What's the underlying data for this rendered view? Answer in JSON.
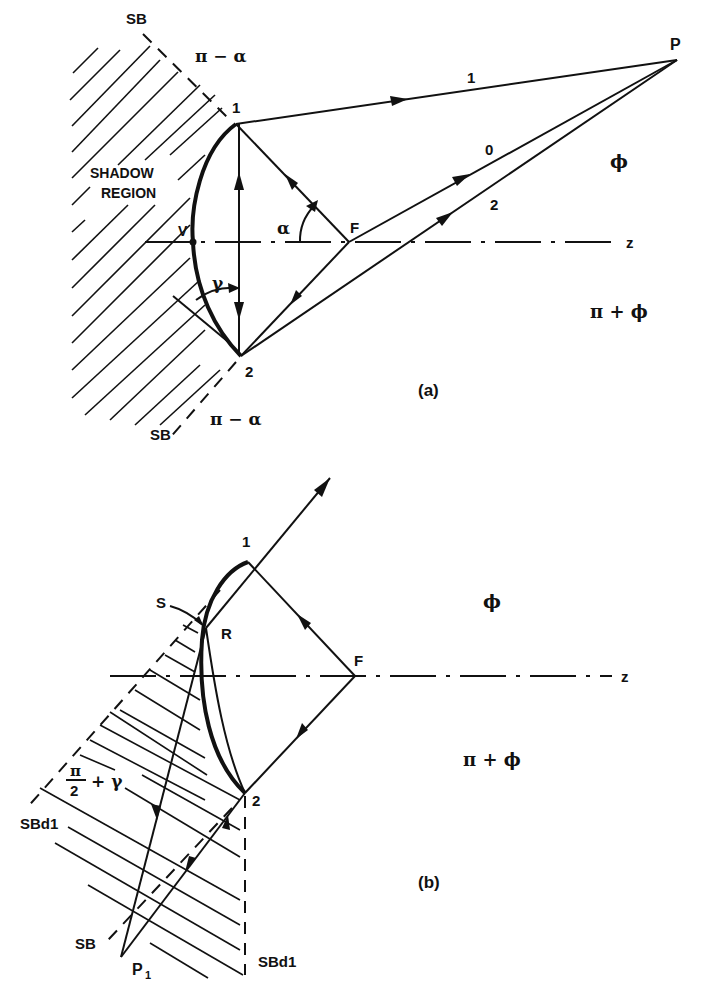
{
  "figure": {
    "panel_a": {
      "caption": "(a)",
      "shadow_region_line1": "SHADOW",
      "shadow_region_line2": "REGION",
      "sb_top": "SB",
      "sb_bottom": "SB",
      "angle_top": "π − α",
      "angle_bottom": "π − α",
      "point_1": "1",
      "point_2": "2",
      "point_v": "V",
      "point_f": "F",
      "point_p": "P",
      "ray_1": "1",
      "ray_0": "0",
      "ray_2": "2",
      "alpha": "α",
      "gamma": "γ",
      "axis_z": "z",
      "phi": "ϕ",
      "pi_plus_phi": "π + ϕ"
    },
    "panel_b": {
      "caption": "(b)",
      "point_1": "1",
      "point_2": "2",
      "point_s": "S",
      "point_r": "R",
      "point_f": "F",
      "point_p1": "P",
      "point_p1_sub": "1",
      "axis_z": "z",
      "phi": "ϕ",
      "pi_plus_phi": "π + ϕ",
      "frac_num": "π",
      "frac_den": "2",
      "frac_rest": "+ γ",
      "sbd1_left": "SBd1",
      "sbd1_right": "SBd1",
      "sb": "SB"
    }
  }
}
